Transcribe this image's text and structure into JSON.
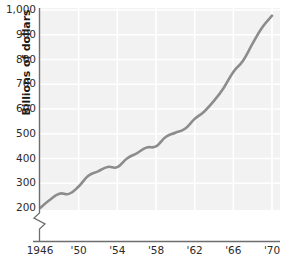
{
  "chart_data": {
    "type": "line",
    "title": "",
    "subtitle": "",
    "xlabel": "",
    "ylabel": "Billions of dollars",
    "xlim": [
      1946,
      1970
    ],
    "ylim": [
      180,
      1000
    ],
    "y_axis_break": true,
    "grid": true,
    "legend": null,
    "line_color": "#8c8c8c",
    "plot_background": "#f2f2f2",
    "gridline_color": "#ffffff",
    "axis_color": "#6e6e6e",
    "yticks": [
      200,
      300,
      400,
      500,
      600,
      700,
      800,
      900,
      1000
    ],
    "ytick_labels": [
      "200",
      "300",
      "400",
      "500",
      "600",
      "700",
      "800",
      "900",
      "1,000"
    ],
    "xticks": [
      1946,
      1950,
      1954,
      1958,
      1962,
      1966,
      1970
    ],
    "xtick_labels": [
      "1946",
      "'50",
      "'54",
      "'58",
      "'62",
      "'66",
      "'70"
    ],
    "x": [
      1946,
      1947,
      1948,
      1949,
      1950,
      1951,
      1952,
      1953,
      1954,
      1955,
      1956,
      1957,
      1958,
      1959,
      1960,
      1961,
      1962,
      1963,
      1964,
      1965,
      1966,
      1967,
      1968,
      1969,
      1970
    ],
    "values": [
      200,
      232,
      258,
      257,
      287,
      330,
      348,
      366,
      365,
      400,
      421,
      444,
      449,
      487,
      504,
      520,
      560,
      590,
      633,
      685,
      750,
      795,
      865,
      930,
      977
    ],
    "series": [
      {
        "name": "Gross national product",
        "values": [
          200,
          232,
          258,
          257,
          287,
          330,
          348,
          366,
          365,
          400,
          421,
          444,
          449,
          487,
          504,
          520,
          560,
          590,
          633,
          685,
          750,
          795,
          865,
          930,
          977
        ]
      }
    ]
  }
}
